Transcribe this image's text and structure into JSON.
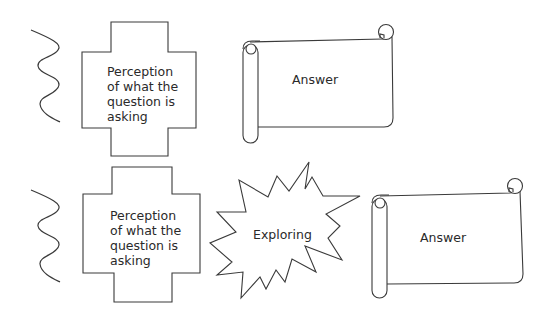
{
  "diagram": {
    "rows": [
      {
        "id": "row-1",
        "steps": [
          {
            "shape": "wavy-line",
            "label": ""
          },
          {
            "shape": "cross",
            "label": "Perception\nof what the\nquestion is\nasking"
          },
          {
            "shape": "scroll",
            "label": "Answer"
          }
        ]
      },
      {
        "id": "row-2",
        "steps": [
          {
            "shape": "wavy-line",
            "label": ""
          },
          {
            "shape": "cross",
            "label": "Perception\nof what the\nquestion is\nasking"
          },
          {
            "shape": "starburst",
            "label": "Exploring"
          },
          {
            "shape": "scroll",
            "label": "Answer"
          }
        ]
      }
    ]
  },
  "colors": {
    "stroke": "#3a3a3a",
    "fill": "#ffffff",
    "text": "#2a2a2a"
  }
}
